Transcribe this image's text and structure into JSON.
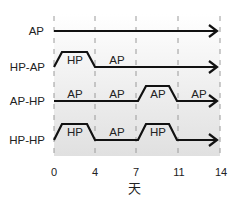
{
  "diagram": {
    "x_axis": {
      "title": "天",
      "ticks": [
        0,
        4,
        7,
        11,
        14
      ]
    },
    "rows": [
      {
        "label": "AP",
        "segments": [],
        "profile": [
          [
            0,
            0
          ],
          [
            14,
            0
          ]
        ]
      },
      {
        "label": "HP-AP",
        "segments": [
          {
            "label": "HP",
            "x": 2,
            "level": "high"
          },
          {
            "label": "AP",
            "x": 7,
            "level": "low"
          }
        ],
        "profile": [
          [
            0,
            0
          ],
          [
            0.8,
            1
          ],
          [
            3.2,
            1
          ],
          [
            4,
            0
          ],
          [
            14,
            0
          ]
        ]
      },
      {
        "label": "AP-HP",
        "segments": [
          {
            "label": "AP",
            "x": 2,
            "level": "low"
          },
          {
            "label": "AP",
            "x": 5.5,
            "level": "low"
          },
          {
            "label": "AP",
            "x": 9,
            "level": "high"
          },
          {
            "label": "AP",
            "x": 12.5,
            "level": "low"
          }
        ],
        "profile": [
          [
            0,
            0
          ],
          [
            7,
            0
          ],
          [
            7.8,
            1
          ],
          [
            10.2,
            1
          ],
          [
            11,
            0
          ],
          [
            14,
            0
          ]
        ]
      },
      {
        "label": "HP-HP",
        "segments": [
          {
            "label": "HP",
            "x": 2,
            "level": "high"
          },
          {
            "label": "AP",
            "x": 5.5,
            "level": "low"
          },
          {
            "label": "HP",
            "x": 9,
            "level": "high"
          }
        ],
        "profile": [
          [
            0,
            0
          ],
          [
            0.8,
            1
          ],
          [
            3.2,
            1
          ],
          [
            4,
            0
          ],
          [
            7,
            0
          ],
          [
            7.8,
            1
          ],
          [
            10.2,
            1
          ],
          [
            11,
            0
          ],
          [
            14,
            0
          ]
        ]
      }
    ],
    "colors": {
      "line": "#111111",
      "gridline": "#9a9a9a",
      "background_bottom": "#e2e2e2"
    }
  }
}
